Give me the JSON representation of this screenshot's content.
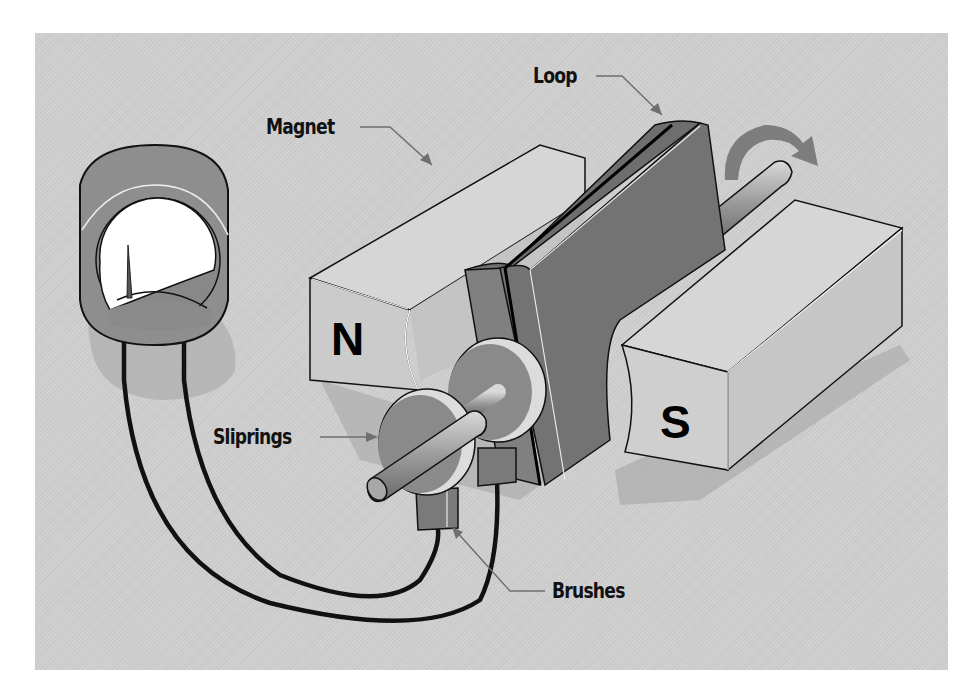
{
  "figure": {
    "type": "generator-diagram",
    "labels": {
      "magnet": "Magnet",
      "loop": "Loop",
      "sliprings": "Sliprings",
      "brushes": "Brushes"
    },
    "poles": {
      "north": "N",
      "south": "S"
    },
    "components": [
      "galvanometer-meter",
      "north-magnet",
      "south-magnet",
      "rotating-loop",
      "shaft",
      "sliprings",
      "brushes",
      "wires",
      "rotation-arrow"
    ],
    "colors": {
      "background": "#cfcfcf",
      "magnet_light": "#d8d8d8",
      "magnet_face": "#c4c4c4",
      "loop_dark": "#7a7a7a",
      "meter_body": "#8c8c8c",
      "meter_face": "#ffffff",
      "wire": "#111111",
      "arrow": "#7d7d7d"
    }
  }
}
